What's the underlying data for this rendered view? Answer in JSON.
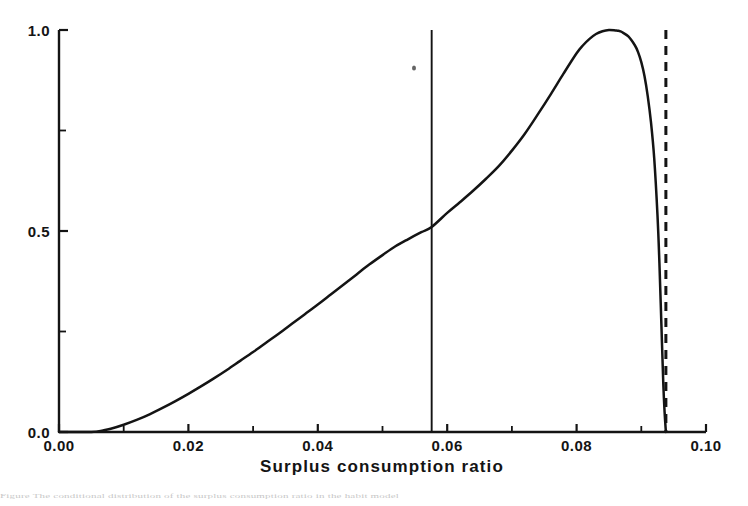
{
  "figure": {
    "background_color": "#ffffff",
    "ink_color": "#141414",
    "footer_fragment": "Figure  The conditional  distribution  of  the  surplus  consumption  ratio  in  the  habit  model"
  },
  "chart_data": {
    "type": "line",
    "title": "",
    "xlabel": "Surplus consumption ratio",
    "ylabel": "",
    "xlim": [
      0.0,
      0.1
    ],
    "ylim": [
      0.0,
      1.0
    ],
    "grid": false,
    "legend": null,
    "x_ticks": [
      0.0,
      0.02,
      0.04,
      0.06,
      0.08,
      0.1
    ],
    "x_tick_labels": [
      "0.00",
      "0.02",
      "0.04",
      "0.06",
      "0.08",
      "0.10"
    ],
    "x_minor_ticks": [
      0.01,
      0.03,
      0.05,
      0.07,
      0.09
    ],
    "y_ticks": [
      0.0,
      0.5,
      1.0
    ],
    "y_tick_labels": [
      "0.0",
      "0.5",
      "1.0"
    ],
    "y_minor_ticks": [
      0.25,
      0.75
    ],
    "series": [
      {
        "name": "density",
        "style": "solid",
        "x": [
          0.0,
          0.005,
          0.0068,
          0.008,
          0.01,
          0.012,
          0.014,
          0.016,
          0.018,
          0.02,
          0.022,
          0.024,
          0.026,
          0.028,
          0.03,
          0.032,
          0.034,
          0.036,
          0.038,
          0.04,
          0.042,
          0.044,
          0.046,
          0.048,
          0.05,
          0.052,
          0.054,
          0.056,
          0.0576,
          0.06,
          0.062,
          0.064,
          0.066,
          0.068,
          0.07,
          0.072,
          0.074,
          0.076,
          0.078,
          0.08,
          0.081,
          0.082,
          0.083,
          0.084,
          0.085,
          0.086,
          0.0865,
          0.087,
          0.088,
          0.089,
          0.0895,
          0.09,
          0.0905,
          0.091,
          0.0915,
          0.092,
          0.0925,
          0.0928,
          0.0931,
          0.0934,
          0.0936,
          0.0938
        ],
        "y": [
          0.0,
          0.0,
          0.004,
          0.008,
          0.018,
          0.03,
          0.044,
          0.06,
          0.077,
          0.095,
          0.114,
          0.134,
          0.155,
          0.177,
          0.199,
          0.222,
          0.245,
          0.269,
          0.293,
          0.317,
          0.342,
          0.367,
          0.392,
          0.417,
          0.44,
          0.462,
          0.48,
          0.497,
          0.51,
          0.545,
          0.572,
          0.6,
          0.63,
          0.662,
          0.7,
          0.742,
          0.79,
          0.84,
          0.892,
          0.942,
          0.962,
          0.978,
          0.99,
          0.997,
          1.0,
          0.999,
          0.998,
          0.995,
          0.984,
          0.962,
          0.945,
          0.92,
          0.885,
          0.835,
          0.77,
          0.68,
          0.54,
          0.42,
          0.27,
          0.12,
          0.05,
          0.0
        ]
      }
    ],
    "annotations": [
      {
        "name": "mean-line",
        "type": "vline",
        "x": 0.0576,
        "style": "solid",
        "y_from": 0.0,
        "y_to": 1.0
      },
      {
        "name": "upper-bound-line",
        "type": "vline",
        "x": 0.0938,
        "style": "dashed",
        "y_from": 0.0,
        "y_to": 1.0
      }
    ]
  }
}
